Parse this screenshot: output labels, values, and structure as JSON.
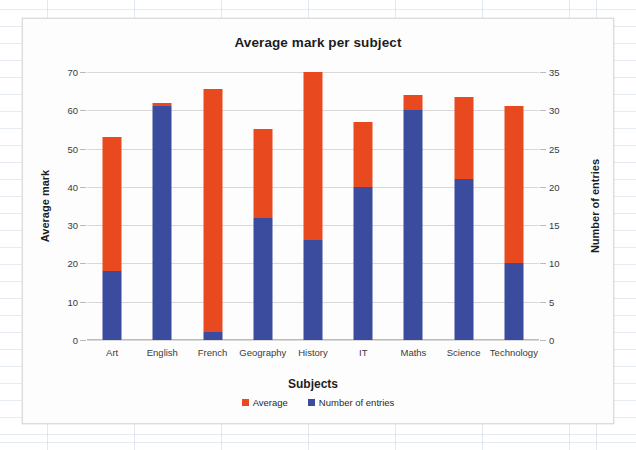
{
  "chart_data": {
    "type": "bar",
    "subtype": "stacked-column-dual-axis",
    "title": "Average mark per subject",
    "xlabel": "Subjects",
    "ylabel": "Average mark",
    "y2label": "Number of entries",
    "categories": [
      "Art",
      "English",
      "French",
      "Geography",
      "History",
      "IT",
      "Maths",
      "Science",
      "Technology"
    ],
    "series": [
      {
        "name": "Number of entries",
        "axis": "right",
        "color": "#3b4b9e",
        "values": [
          9,
          30.5,
          1,
          16,
          13,
          20,
          30,
          21,
          10
        ]
      },
      {
        "name": "Average",
        "axis": "left",
        "color": "#e8491e",
        "values": [
          35,
          1,
          63.5,
          23,
          44,
          17,
          4,
          21.5,
          41
        ]
      }
    ],
    "stack_totals_left_axis": [
      53.5,
      62,
      65.5,
      55.5,
      70.5,
      57.5,
      64.5,
      64,
      61.5
    ],
    "ylim": [
      0,
      70
    ],
    "yticks": [
      0,
      10,
      20,
      30,
      40,
      50,
      60,
      70
    ],
    "y2lim": [
      0,
      35
    ],
    "y2ticks": [
      0,
      5,
      10,
      15,
      20,
      25,
      30,
      35
    ],
    "grid": true,
    "legend_position": "bottom",
    "legend": [
      "Average",
      "Number of entries"
    ]
  },
  "legend_entries": [
    {
      "label": "Average",
      "color": "#e8491e"
    },
    {
      "label": "Number of entries",
      "color": "#3b4b9e"
    }
  ],
  "axis": {
    "left_title": "Average mark",
    "right_title": "Number of entries",
    "x_title": "Subjects"
  },
  "colors": {
    "average": "#e8491e",
    "entries": "#3b4b9e",
    "gridline": "#d9d9d9",
    "text": "#2a2a2a"
  }
}
